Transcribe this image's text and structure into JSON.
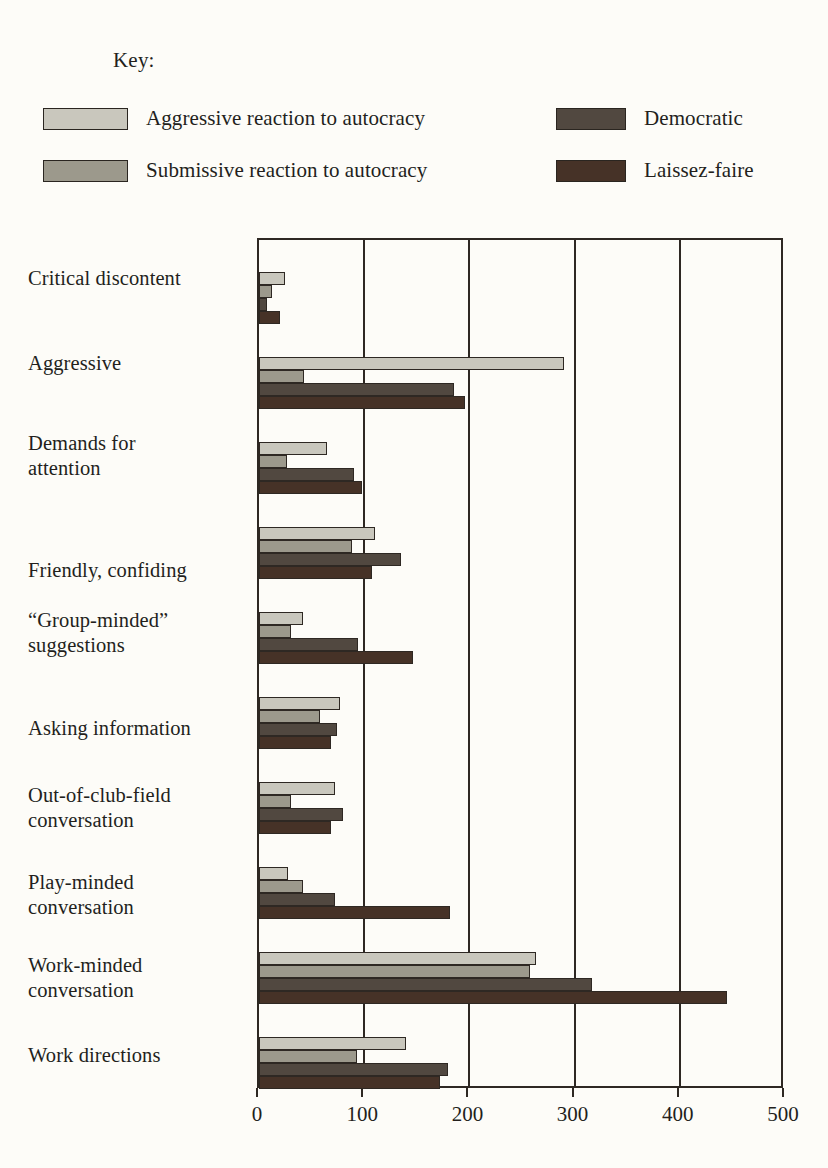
{
  "legend": {
    "title": "Key:",
    "entries": [
      {
        "label": "Aggressive reaction to autocracy",
        "color": "#c9c7bd",
        "column": 1,
        "row": 1
      },
      {
        "label": "Submissive reaction to autocracy",
        "color": "#9c998c",
        "column": 1,
        "row": 2
      },
      {
        "label": "Democratic",
        "color": "#514840",
        "column": 2,
        "row": 1
      },
      {
        "label": "Laissez-faire",
        "color": "#463227",
        "column": 2,
        "row": 2
      }
    ]
  },
  "chart_data": {
    "type": "bar",
    "orientation": "horizontal",
    "title": "",
    "xlabel": "",
    "ylabel": "",
    "xlim": [
      0,
      500
    ],
    "xticks": [
      0,
      100,
      200,
      300,
      400,
      500
    ],
    "xticklabels": [
      "0",
      "100",
      "200",
      "300",
      "400",
      "500"
    ],
    "grid": true,
    "legend_position": "top",
    "categories": [
      "Critical discontent",
      "Aggressive",
      "Demands for\nattention",
      "Friendly, confiding",
      "“Group-minded”\nsuggestions",
      "Asking information",
      "Out-of-club-field\nconversation",
      "Play-minded\nconversation",
      "Work-minded\nconversation",
      "Work directions"
    ],
    "series": [
      {
        "name": "Aggressive reaction to autocracy",
        "color": "#c9c7bd",
        "values": [
          25,
          290,
          65,
          110,
          42,
          77,
          72,
          28,
          263,
          140
        ]
      },
      {
        "name": "Submissive reaction to autocracy",
        "color": "#9c998c",
        "values": [
          12,
          43,
          27,
          88,
          30,
          58,
          30,
          42,
          258,
          93
        ]
      },
      {
        "name": "Democratic",
        "color": "#514840",
        "values": [
          8,
          185,
          90,
          135,
          94,
          74,
          80,
          72,
          317,
          180
        ]
      },
      {
        "name": "Laissez-faire",
        "color": "#463227",
        "values": [
          20,
          196,
          98,
          107,
          146,
          68,
          68,
          182,
          445,
          172
        ]
      }
    ]
  },
  "layout": {
    "category_label_tops": [
      28,
      113,
      193,
      320,
      370,
      478,
      545,
      632,
      715,
      805
    ],
    "group_tops": [
      32,
      117,
      202,
      287,
      372,
      457,
      542,
      627,
      712,
      797
    ]
  }
}
